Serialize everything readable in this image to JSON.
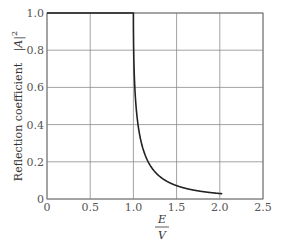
{
  "chart_data": {
    "type": "line",
    "title": "",
    "xlabel_numerator": "E",
    "xlabel_denominator": "V",
    "xlabel": "E/V",
    "ylabel": "Reflection  coefficient   |A|²",
    "ylabel_text": "Reflection  coefficient",
    "ylabel_math": "|A|",
    "ylabel_exp": "2",
    "xlim": [
      0,
      2.5
    ],
    "ylim": [
      0,
      1.0
    ],
    "grid": true,
    "legend": null,
    "x_ticks": [
      0,
      0.5,
      1.0,
      1.5,
      2.0,
      2.5
    ],
    "x_tick_labels": [
      "0",
      "0.5",
      "1.0",
      "1.5",
      "2.0",
      "2.5"
    ],
    "y_ticks": [
      0,
      0.2,
      0.4,
      0.6,
      0.8,
      1.0
    ],
    "y_tick_labels": [
      "0",
      "0.2",
      "0.4",
      "0.6",
      "0.8",
      "1.0"
    ],
    "series": [
      {
        "name": "Reflection coefficient",
        "color": "#222222",
        "x": [
          0,
          0.5,
          0.99,
          1.0,
          1.005,
          1.01,
          1.02,
          1.03,
          1.05,
          1.07,
          1.1,
          1.15,
          1.2,
          1.3,
          1.4,
          1.5,
          1.6,
          1.7,
          1.8,
          1.9,
          2.0,
          2.03
        ],
        "values": [
          1.0,
          1.0,
          1.0,
          1.0,
          0.752,
          0.669,
          0.566,
          0.499,
          0.412,
          0.353,
          0.292,
          0.228,
          0.182,
          0.127,
          0.095,
          0.072,
          0.057,
          0.046,
          0.037,
          0.031,
          0.029,
          0.027
        ]
      }
    ]
  }
}
